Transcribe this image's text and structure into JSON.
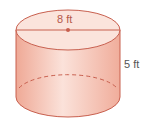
{
  "figure": {
    "shape": "cylinder",
    "diameter_label": "8 ft",
    "height_label": "5 ft",
    "colors": {
      "fill_side": "#f4b7a6",
      "fill_top": "#fbe4dc",
      "stroke": "#c8604f",
      "label_top": "#b5594a",
      "label_side": "#555555"
    }
  }
}
